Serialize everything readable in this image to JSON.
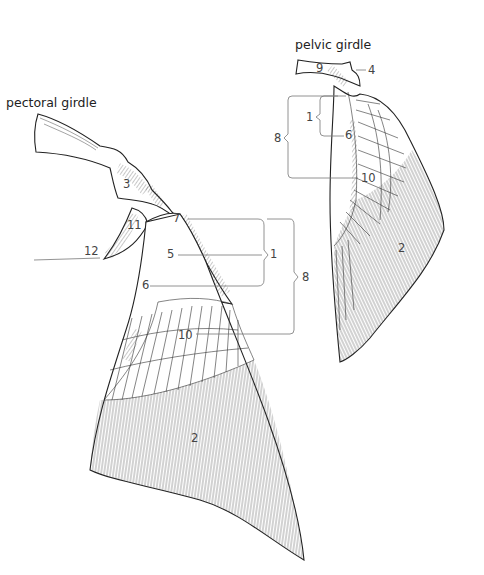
{
  "diagram": {
    "pectoral": {
      "title": "pectoral girdle",
      "labels": {
        "l3": "3",
        "l7": "7",
        "l11": "11",
        "l12": "12",
        "l5": "5",
        "l1": "1",
        "l8": "8",
        "l6": "6",
        "l10": "10",
        "l2": "2"
      }
    },
    "pelvic": {
      "title": "pelvic girdle",
      "labels": {
        "l9": "9",
        "l4": "4",
        "l1": "1",
        "l8": "8",
        "l6": "6",
        "l10": "10",
        "l2": "2"
      }
    }
  }
}
